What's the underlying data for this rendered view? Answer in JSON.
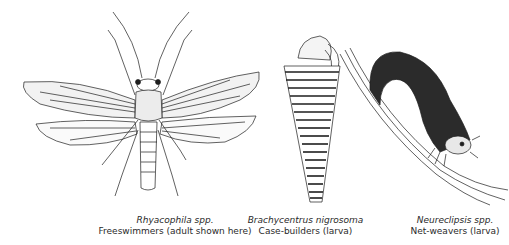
{
  "figure": {
    "panels": [
      {
        "id": "rhyacophila",
        "species": "Rhyacophila spp.",
        "description": "Freeswimmers (adult shown here)",
        "illustration": "adult-caddisfly-drawing"
      },
      {
        "id": "brachycentrus",
        "species": "Brachycentrus nigrosoma",
        "description": "Case-builders (larva)",
        "illustration": "case-building-larva-drawing"
      },
      {
        "id": "neureclipsis",
        "species": "Neureclipsis spp.",
        "description": "Net-weavers (larva)",
        "illustration": "net-weaving-larva-drawing"
      }
    ],
    "line_color": "#1e1e1e",
    "background": "#ffffff"
  }
}
